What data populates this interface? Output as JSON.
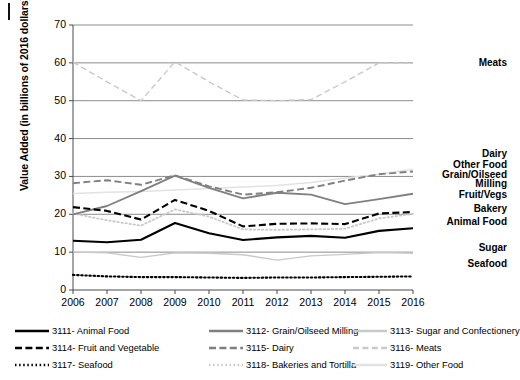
{
  "chart_data": {
    "type": "line",
    "title": "",
    "xlabel": "",
    "ylabel": "Value Added (in billions of 2016 dollars)",
    "ylim": [
      0,
      70
    ],
    "yticks": [
      0,
      10,
      20,
      30,
      40,
      50,
      60,
      70
    ],
    "grid": true,
    "legend_position": "bottom",
    "categories": [
      2006,
      2007,
      2008,
      2009,
      2010,
      2011,
      2012,
      2013,
      2014,
      2015,
      2016
    ],
    "x": [
      "2006",
      "2007",
      "2008",
      "2009",
      "2010",
      "2011",
      "2012",
      "2013",
      "2014",
      "2015",
      "2016"
    ],
    "series": [
      {
        "name": "3111- Animal Food",
        "short": "Animal Food",
        "style": "solid-black",
        "values": [
          13.0,
          12.6,
          13.3,
          17.7,
          15.0,
          13.2,
          13.9,
          14.3,
          13.8,
          15.6,
          16.3
        ]
      },
      {
        "name": "3112- Grain/Oilseed Milling",
        "short": "Grain/Oilseed Milling",
        "style": "solid-gray",
        "values": [
          20.0,
          22.2,
          26.1,
          30.2,
          27.0,
          24.2,
          25.7,
          25.2,
          22.7,
          24.0,
          25.4
        ]
      },
      {
        "name": "3113- Sugar and Confectionery",
        "short": "Sugar",
        "style": "solid-lightgray",
        "values": [
          10.0,
          9.8,
          8.6,
          9.8,
          9.7,
          9.3,
          7.9,
          9.0,
          9.4,
          9.9,
          9.7
        ]
      },
      {
        "name": "3114- Fruit and Vegetable",
        "short": "Fruit/Vegs",
        "style": "dash-black",
        "values": [
          21.9,
          20.9,
          18.6,
          23.8,
          20.9,
          16.8,
          17.5,
          17.6,
          17.4,
          20.2,
          20.6
        ]
      },
      {
        "name": "3115- Dairy",
        "short": "Dairy",
        "style": "dash-gray",
        "values": [
          28.2,
          29.0,
          27.8,
          30.3,
          27.4,
          25.2,
          25.8,
          27.0,
          28.9,
          30.6,
          31.3
        ]
      },
      {
        "name": "3116- Meats",
        "short": "Meats",
        "style": "dash-lightgray",
        "values": [
          60.2,
          55.0,
          50.0,
          60.3,
          55.0,
          50.2,
          50.0,
          50.3,
          55.0,
          60.0,
          59.9
        ]
      },
      {
        "name": "3117- Seafood",
        "short": "Seafood",
        "style": "dot-black",
        "values": [
          4.0,
          3.6,
          3.4,
          3.4,
          3.3,
          3.2,
          3.3,
          3.3,
          3.4,
          3.5,
          3.6
        ]
      },
      {
        "name": "3118- Bakeries and Tortilla",
        "short": "Bakery",
        "style": "dot-gray",
        "values": [
          20.2,
          18.4,
          17.0,
          21.3,
          19.4,
          16.0,
          15.9,
          16.0,
          16.2,
          18.9,
          20.1
        ]
      },
      {
        "name": "3119- Other Food",
        "short": "Other Food",
        "style": "solid-faint",
        "values": [
          25.5,
          25.8,
          26.0,
          26.4,
          26.8,
          27.2,
          27.6,
          28.4,
          29.6,
          30.6,
          31.9
        ]
      }
    ],
    "right_labels": [
      {
        "text": "Meats",
        "value": 60
      },
      {
        "text": "Dairy",
        "value": 36
      },
      {
        "text": "Other Food",
        "value": 33
      },
      {
        "text": "Grain/Oilseed",
        "value": 30.5
      },
      {
        "text": "Milling",
        "value": 28
      },
      {
        "text": "Fruit/Vegs",
        "value": 25
      },
      {
        "text": "Bakery",
        "value": 21.5
      },
      {
        "text": "Animal Food",
        "value": 18
      },
      {
        "text": "Sugar",
        "value": 11
      },
      {
        "text": "Seafood",
        "value": 7
      }
    ]
  },
  "axes": {
    "y_title": "Value Added (in billions of 2016 dollars)",
    "y_ticks": [
      "70",
      "60",
      "50",
      "40",
      "30",
      "20",
      "10",
      "0"
    ],
    "x_ticks": [
      "2006",
      "2007",
      "2008",
      "2009",
      "2010",
      "2011",
      "2012",
      "2013",
      "2014",
      "2015",
      "2016"
    ]
  },
  "right_labels": {
    "meats": "Meats",
    "dairy": "Dairy",
    "other_food": "Other Food",
    "grain_oilseed": "Grain/Oilseed",
    "milling": "Milling",
    "fruit_vegs": "Fruit/Vegs",
    "bakery": "Bakery",
    "animal_food": "Animal Food",
    "sugar": "Sugar",
    "seafood": "Seafood"
  },
  "legend": {
    "items": [
      {
        "label": "3111- Animal Food",
        "style": "solid-black"
      },
      {
        "label": "3112- Grain/Oilseed Milling",
        "style": "solid-gray"
      },
      {
        "label": "3113- Sugar and Confectionery",
        "style": "solid-lightgray"
      },
      {
        "label": "3114- Fruit and Vegetable",
        "style": "dash-black"
      },
      {
        "label": "3115- Dairy",
        "style": "dash-gray"
      },
      {
        "label": "3116- Meats",
        "style": "dash-lightgray"
      },
      {
        "label": "3117- Seafood",
        "style": "dot-black"
      },
      {
        "label": "3118- Bakeries and Tortilla",
        "style": "dot-gray"
      },
      {
        "label": "3119- Other Food",
        "style": "solid-faint"
      }
    ]
  },
  "colors": {
    "black": "#000000",
    "gray": "#808080",
    "lightgray": "#c9c9c9",
    "faint": "#e2e2e2",
    "gridline": "#6f6f6f",
    "background": "#ffffff"
  }
}
